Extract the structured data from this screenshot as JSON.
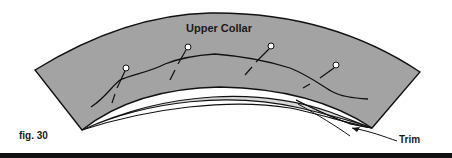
{
  "figure": {
    "title": "Upper Collar",
    "caption": "fig. 30",
    "callout": "Trim",
    "colors": {
      "collar_fill": "#a3a3a3",
      "underlayer_fill": "#d8d8d8",
      "outline": "#111111",
      "background": "#ffffff",
      "rule": "#111111"
    },
    "pins_count": 4
  }
}
